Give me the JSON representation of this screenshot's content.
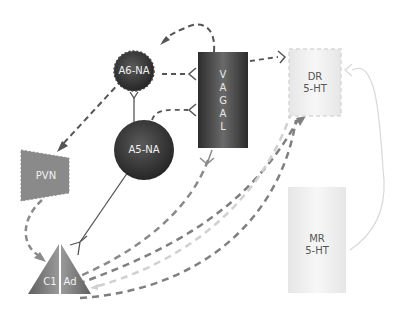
{
  "diagram": {
    "nodes": {
      "a6": {
        "label": "A6-NA",
        "shape": "circle",
        "color": "#3a3a3a"
      },
      "a5": {
        "label": "A5-NA",
        "shape": "circle",
        "color": "#3a3a3a"
      },
      "vagal": {
        "label": "VAGAL",
        "letters": [
          "V",
          "A",
          "G",
          "A",
          "L"
        ],
        "shape": "rectangle",
        "color": "#3e3e3e"
      },
      "dr": {
        "label_line1": "DR",
        "label_line2": "5-HT",
        "shape": "dashed-rectangle",
        "color": "#ededed"
      },
      "mr": {
        "label_line1": "MR",
        "label_line2": "5-HT",
        "shape": "rectangle",
        "color": "#efefef"
      },
      "pvn": {
        "label": "PVN",
        "shape": "trapezoid",
        "color": "#8a8a8a"
      },
      "c1": {
        "label": "C1",
        "shape": "half-triangle",
        "color": "#7a7a7a"
      },
      "ad": {
        "label": "Ad",
        "shape": "half-triangle",
        "color": "#7a7a7a"
      }
    },
    "colors": {
      "dark_line": "#555555",
      "mid_dash": "#7f7f7f",
      "light_dash": "#d0d0d0",
      "solid_light": "#d8d8d8"
    }
  }
}
